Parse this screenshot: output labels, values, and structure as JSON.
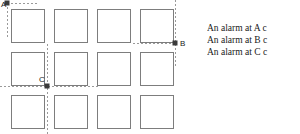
{
  "diagram": {
    "grid": {
      "columns_x": [
        11,
        54,
        97,
        140
      ],
      "rows_y": [
        9,
        52,
        95
      ],
      "cell_width": 33,
      "cell_height": 33,
      "stroke_color": "#7d7d7d"
    },
    "guide_color": "#9a9a9a",
    "dot_color": "#3a3a3a",
    "nodes": [
      {
        "id": "A",
        "label": "A",
        "dot_x": 7,
        "dot_y": 3,
        "label_x": 1,
        "label_y": 5,
        "h_line": {
          "x1": 7,
          "x2": 38,
          "y": 3
        },
        "v_line": {
          "x": 7,
          "y1": 3,
          "y2": 39
        }
      },
      {
        "id": "B",
        "label": "B",
        "dot_x": 175,
        "dot_y": 43,
        "label_x": 180,
        "label_y": 44,
        "h_line": {
          "x1": 133,
          "x2": 175,
          "y": 43
        },
        "v_line": {
          "x": 175,
          "y1": 0,
          "y2": 68
        }
      },
      {
        "id": "C",
        "label": "C",
        "dot_x": 47,
        "dot_y": 86,
        "label_x": 39,
        "label_y": 80,
        "h_line": {
          "x1": 0,
          "x2": 100,
          "y": 86
        },
        "v_line": {
          "x": 47,
          "y1": 44,
          "y2": 134
        }
      }
    ]
  },
  "captions": {
    "lines": [
      "An alarm at A c",
      "An alarm at B c",
      "An alarm at C c"
    ]
  }
}
